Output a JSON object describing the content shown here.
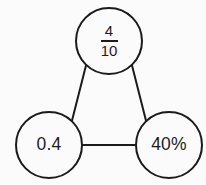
{
  "diagram": {
    "type": "equivalence-triangle",
    "title": "",
    "background_color": "#fbfbfb",
    "stroke_color": "#1b1b1b",
    "stroke_width": 2,
    "nodes": [
      {
        "id": "fraction-node",
        "label": "4/10",
        "format": "fraction",
        "numerator": "4",
        "denominator": "10",
        "cx": 109,
        "cy": 41,
        "r": 33
      },
      {
        "id": "decimal-node",
        "label": "0.4",
        "format": "decimal",
        "cx": 49,
        "cy": 145,
        "r": 33
      },
      {
        "id": "percent-node",
        "label": "40%",
        "format": "percent",
        "cx": 169,
        "cy": 145,
        "r": 33
      }
    ],
    "edges": [
      {
        "id": "edge-fraction-decimal",
        "from": "fraction-node",
        "to": "decimal-node"
      },
      {
        "id": "edge-fraction-percent",
        "from": "fraction-node",
        "to": "percent-node"
      },
      {
        "id": "edge-decimal-percent",
        "from": "decimal-node",
        "to": "percent-node"
      }
    ]
  }
}
